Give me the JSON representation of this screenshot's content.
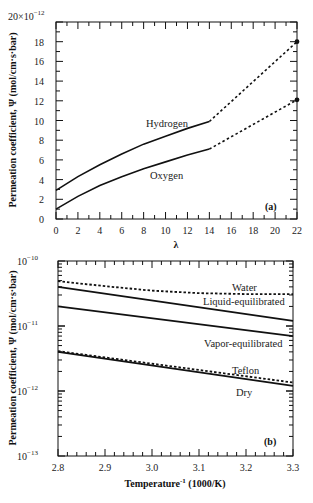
{
  "chart_data": [
    {
      "type": "line",
      "panel_label": "(a)",
      "xlabel": "λ",
      "ylabel": "Permeation coefficient,  Ψ (mol/cm·s·bar)",
      "y_multiplier_label": "20×10",
      "y_multiplier_exp": "−12",
      "xlim": [
        0,
        22
      ],
      "ylim": [
        0,
        20
      ],
      "yscale": "linear",
      "x_ticks": [
        0,
        2,
        4,
        6,
        8,
        10,
        12,
        14,
        16,
        18,
        20,
        22
      ],
      "y_ticks": [
        0,
        2,
        4,
        6,
        8,
        10,
        12,
        14,
        16,
        18
      ],
      "y_tick_exponent": "×10^-12",
      "grid": false,
      "series": [
        {
          "name": "Hydrogen",
          "solid": {
            "x": [
              0,
              2,
              4,
              6,
              8,
              10,
              12,
              14
            ],
            "y": [
              2.9,
              4.3,
              5.5,
              6.6,
              7.6,
              8.4,
              9.2,
              9.9
            ]
          },
          "dashed": {
            "x": [
              14,
              22
            ],
            "y": [
              9.9,
              18.0
            ]
          },
          "marker_point": {
            "x": 22,
            "y": 18.0
          }
        },
        {
          "name": "Oxygen",
          "solid": {
            "x": [
              0,
              2,
              4,
              6,
              8,
              10,
              12,
              14
            ],
            "y": [
              1.0,
              2.3,
              3.4,
              4.3,
              5.1,
              5.8,
              6.5,
              7.1
            ]
          },
          "dashed": {
            "x": [
              14,
              22
            ],
            "y": [
              7.1,
              12.1
            ]
          },
          "marker_point": {
            "x": 22,
            "y": 12.1
          }
        }
      ]
    },
    {
      "type": "line",
      "panel_label": "(b)",
      "xlabel": "Temperature",
      "xlabel_sup": "-1",
      "xlabel_unit": " (1000/K)",
      "ylabel": "Permeation coefficient,  Ψ (mol/cm·s·bar)",
      "xlim": [
        2.8,
        3.3
      ],
      "ylim": [
        1e-13,
        1e-10
      ],
      "yscale": "log",
      "x_ticks": [
        "2.8",
        "2.9",
        "3.0",
        "3.1",
        "3.2",
        "3.3"
      ],
      "y_ticks": [
        {
          "base": "10",
          "exp": "−10",
          "value": 1e-10
        },
        {
          "base": "10",
          "exp": "−11",
          "value": 1e-11
        },
        {
          "base": "10",
          "exp": "−12",
          "value": 1e-12
        },
        {
          "base": "10",
          "exp": "−13",
          "value": 1e-13
        }
      ],
      "grid": false,
      "series": [
        {
          "name": "Water",
          "style": "dashed",
          "x": [
            2.8,
            2.9,
            3.0,
            3.1,
            3.2,
            3.3
          ],
          "y": [
            4.9e-11,
            4.1e-11,
            3.5e-11,
            3.2e-11,
            3.1e-11,
            3.1e-11
          ]
        },
        {
          "name": "Liquid-equilibrated",
          "style": "solid",
          "x": [
            2.8,
            3.3
          ],
          "y": [
            4e-11,
            1.2e-11
          ]
        },
        {
          "name": "Vapor-equilibrated",
          "style": "solid",
          "x": [
            2.8,
            3.3
          ],
          "y": [
            2e-11,
            7e-12
          ]
        },
        {
          "name": "Teflon",
          "style": "dashed",
          "x": [
            2.8,
            3.3
          ],
          "y": [
            4.1e-12,
            1.35e-12
          ]
        },
        {
          "name": "Dry",
          "style": "solid",
          "x": [
            2.8,
            3.3
          ],
          "y": [
            4e-12,
            1.2e-12
          ]
        }
      ]
    }
  ]
}
